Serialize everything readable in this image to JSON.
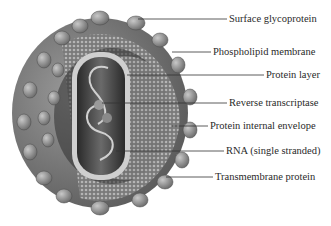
{
  "diagram": {
    "labels": [
      {
        "id": "surface-glycoprotein",
        "text": "Surface glycoprotein",
        "x": 229,
        "y": 13
      },
      {
        "id": "phospholipid-membrane",
        "text": "Phospholipid membrane",
        "x": 213,
        "y": 46
      },
      {
        "id": "protein-layer",
        "text": "Protein layer",
        "x": 266,
        "y": 69
      },
      {
        "id": "reverse-transcriptase",
        "text": "Reverse transcriptase",
        "x": 229,
        "y": 97
      },
      {
        "id": "protein-internal-envelope",
        "text": "Protein internal envelope",
        "x": 210,
        "y": 120
      },
      {
        "id": "rna-single-stranded",
        "text": "RNA (single stranded)",
        "x": 226,
        "y": 145
      },
      {
        "id": "transmembrane-protein",
        "text": "Transmembrane protein",
        "x": 215,
        "y": 171
      }
    ],
    "colors": {
      "background": "#ffffff",
      "knob": "#8c8c8c",
      "shell": "#6e6e6e",
      "core": "#3a3a3a",
      "line": "#333333",
      "text": "#2a2a2a"
    }
  }
}
